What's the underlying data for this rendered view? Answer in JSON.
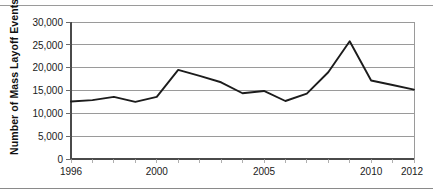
{
  "figure": {
    "top_rule": "horizontal-rule",
    "bottom_rule": "horizontal-rule"
  },
  "chart_data": {
    "type": "line",
    "title": "",
    "xlabel": "",
    "ylabel": "Number of Mass Layoff Events",
    "x": [
      1996,
      1997,
      1998,
      1999,
      2000,
      2001,
      2002,
      2003,
      2004,
      2005,
      2006,
      2007,
      2008,
      2009,
      2010,
      2011,
      2012
    ],
    "values": [
      12600,
      12900,
      13600,
      12500,
      13600,
      19500,
      18200,
      16800,
      14400,
      14900,
      12700,
      14300,
      19000,
      25800,
      17200,
      16200,
      15200
    ],
    "series": [
      {
        "name": "Mass Layoff Events",
        "values": [
          12600,
          12900,
          13600,
          12500,
          13600,
          19500,
          18200,
          16800,
          14400,
          14900,
          12700,
          14300,
          19000,
          25800,
          17200,
          16200,
          15200
        ]
      }
    ],
    "xlim": [
      1996,
      2012
    ],
    "ylim": [
      0,
      30000
    ],
    "xticks": [
      1996,
      1997,
      1998,
      1999,
      2000,
      2001,
      2002,
      2003,
      2004,
      2005,
      2006,
      2007,
      2008,
      2009,
      2010,
      2011,
      2012
    ],
    "xtick_labels_shown": [
      "1996",
      "2000",
      "2005",
      "2010",
      "2012"
    ],
    "xtick_label_positions": [
      1996,
      2000,
      2005,
      2010,
      2012
    ],
    "yticks": [
      0,
      5000,
      10000,
      15000,
      20000,
      25000,
      30000
    ],
    "ytick_labels": [
      "0",
      "5,000",
      "10,000",
      "15,000",
      "20,000",
      "25,000",
      "30,000"
    ],
    "grid": true,
    "grid_axis": "y",
    "legend": false,
    "legend_position": "none",
    "line_color": "#1c1c1c",
    "grid_color": "#8f8f8f",
    "background_color": "#ffffff"
  },
  "axes": {
    "y_axis_title": "Number of Mass Layoff Events",
    "y_labels": {
      "t0": "0",
      "t1": "5,000",
      "t2": "10,000",
      "t3": "15,000",
      "t4": "20,000",
      "t5": "25,000",
      "t6": "30,000"
    },
    "x_labels": {
      "x1996": "1996",
      "x2000": "2000",
      "x2005": "2005",
      "x2010": "2010",
      "x2012": "2012"
    }
  }
}
